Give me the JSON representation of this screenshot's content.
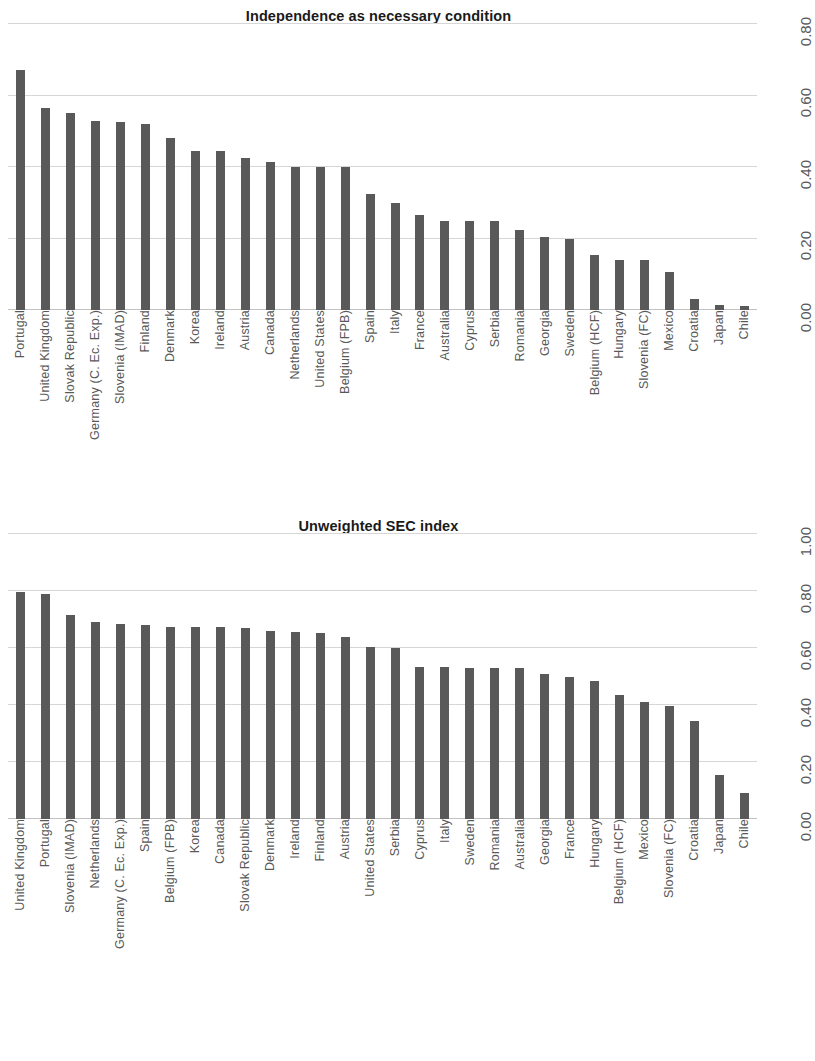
{
  "chart_data": [
    {
      "type": "bar",
      "title": "Independence as necessary condition",
      "xlabel": "",
      "ylabel": "",
      "ylim": [
        0,
        0.8
      ],
      "grid": true,
      "legend": "none",
      "yticks": [
        "0.00",
        "0.20",
        "0.40",
        "0.60",
        "0.80"
      ],
      "ytick_values": [
        0.0,
        0.2,
        0.4,
        0.6,
        0.8
      ],
      "categories": [
        "Portugal",
        "United Kingdom",
        "Slovak Republic",
        "Germany (C. Ec. Exp.)",
        "Slovenia (IMAD)",
        "Finland",
        "Denmark",
        "Korea",
        "Ireland",
        "Austria",
        "Canada",
        "Netherlands",
        "United States",
        "Belgium (FPB)",
        "Spain",
        "Italy",
        "France",
        "Australia",
        "Cyprus",
        "Serbia",
        "Romania",
        "Georgia",
        "Sweden",
        "Belgium (HCF)",
        "Hungary",
        "Slovenia (FC)",
        "Mexico",
        "Croatia",
        "Japan",
        "Chile"
      ],
      "values": [
        0.67,
        0.565,
        0.55,
        0.53,
        0.525,
        0.52,
        0.48,
        0.445,
        0.445,
        0.425,
        0.415,
        0.4,
        0.4,
        0.4,
        0.325,
        0.3,
        0.265,
        0.25,
        0.25,
        0.25,
        0.225,
        0.205,
        0.2,
        0.155,
        0.14,
        0.14,
        0.105,
        0.03,
        0.015,
        0.01
      ]
    },
    {
      "type": "bar",
      "title": "Unweighted SEC index",
      "xlabel": "",
      "ylabel": "",
      "ylim": [
        0,
        1.0
      ],
      "grid": true,
      "legend": "none",
      "yticks": [
        "0.00",
        "0.20",
        "0.40",
        "0.60",
        "0.80",
        "1.00"
      ],
      "ytick_values": [
        0.0,
        0.2,
        0.4,
        0.6,
        0.8,
        1.0
      ],
      "categories": [
        "United Kingdom",
        "Portugal",
        "Slovenia (IMAD)",
        "Netherlands",
        "Germany (C. Ec. Exp.)",
        "Spain",
        "Belgium (FPB)",
        "Korea",
        "Canada",
        "Slovak Republic",
        "Denmark",
        "Ireland",
        "Finland",
        "Austria",
        "United States",
        "Serbia",
        "Cyprus",
        "Italy",
        "Sweden",
        "Romania",
        "Australia",
        "Georgia",
        "France",
        "Hungary",
        "Belgium (HCF)",
        "Mexico",
        "Slovenia (FC)",
        "Croatia",
        "Japan",
        "Chile"
      ],
      "values": [
        0.795,
        0.79,
        0.715,
        0.69,
        0.685,
        0.68,
        0.675,
        0.675,
        0.672,
        0.67,
        0.66,
        0.655,
        0.652,
        0.64,
        0.605,
        0.6,
        0.535,
        0.535,
        0.53,
        0.53,
        0.53,
        0.51,
        0.5,
        0.485,
        0.435,
        0.41,
        0.395,
        0.345,
        0.155,
        0.09
      ]
    }
  ]
}
